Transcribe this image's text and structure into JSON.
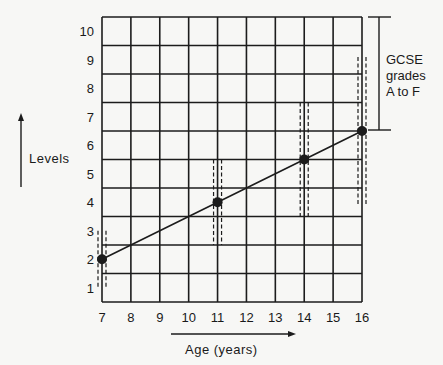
{
  "chart_data": {
    "type": "line",
    "title": "",
    "xlabel": "Age (years)",
    "ylabel": "Levels",
    "x_ticks": [
      "7",
      "8",
      "9",
      "10",
      "11",
      "12",
      "13",
      "14",
      "15",
      "16"
    ],
    "y_ticks": [
      "1",
      "2",
      "3",
      "4",
      "5",
      "6",
      "7",
      "8",
      "9",
      "10"
    ],
    "xlim": [
      7,
      16
    ],
    "ylim": [
      0.5,
      10.5
    ],
    "grid": true,
    "series": [
      {
        "name": "Expected level",
        "x": [
          7,
          11,
          14,
          16
        ],
        "y": [
          2,
          4,
          5.5,
          6.5
        ],
        "markers": true,
        "dashed_range_bars": true
      }
    ],
    "annotations": [
      {
        "text_lines": [
          "GCSE",
          "grades",
          "A to F"
        ],
        "type": "bracket",
        "y_from": 6.5,
        "y_to": 10.5,
        "position": "right"
      }
    ]
  },
  "labels": {
    "y_axis": "Levels",
    "x_axis": "Age (years)",
    "gcse_line1": "GCSE",
    "gcse_line2": "grades",
    "gcse_line3": "A to F"
  },
  "colors": {
    "ink": "#1c1c1c",
    "paper": "#f7f7f5"
  }
}
